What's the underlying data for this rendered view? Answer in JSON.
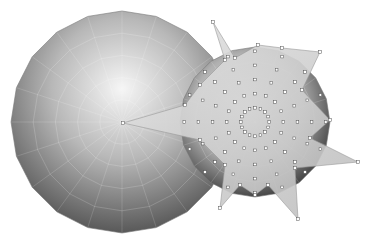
{
  "scene": {
    "description": "3D polygonal sphere models with star-shaped spiked vertex extrusion",
    "background": "#ffffff",
    "large_sphere": {
      "cx": 122,
      "cy": 122,
      "r": 111,
      "segments": 20,
      "colors": {
        "highlight": "#f4f4f4",
        "mid": "#a9a9a9",
        "shadow": "#4e4e4e"
      }
    },
    "small_sphere": {
      "cx": 255,
      "cy": 122,
      "r": 75,
      "segments": 20,
      "colors": {
        "highlight": "#f0f0f0",
        "mid": "#b5b5b5",
        "shadow": "#3a3a3a"
      }
    },
    "star": {
      "center": [
        255,
        118
      ],
      "points": [
        [
          213,
          22
        ],
        [
          235,
          58
        ],
        [
          258,
          45
        ],
        [
          282,
          48
        ],
        [
          320,
          52
        ],
        [
          302,
          90
        ],
        [
          330,
          120
        ],
        [
          310,
          138
        ],
        [
          358,
          162
        ],
        [
          295,
          168
        ],
        [
          298,
          219
        ],
        [
          268,
          185
        ],
        [
          255,
          195
        ],
        [
          240,
          185
        ],
        [
          220,
          208
        ],
        [
          225,
          165
        ],
        [
          200,
          140
        ],
        [
          123,
          123
        ],
        [
          185,
          105
        ],
        [
          200,
          85
        ],
        [
          225,
          60
        ]
      ],
      "fill": "#d6d6d6",
      "vertex_color": "#555555"
    }
  }
}
